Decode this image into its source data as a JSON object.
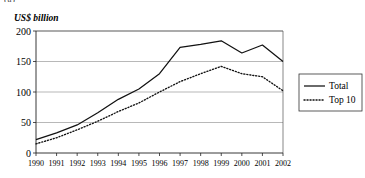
{
  "figure": {
    "caption_fragment": "(a)",
    "y_axis_title": "US$ billion"
  },
  "legend": {
    "position": "right",
    "entries": [
      {
        "label": "Total",
        "style": "solid"
      },
      {
        "label": "Top 10",
        "style": "dotted"
      }
    ]
  },
  "chart_data": {
    "type": "line",
    "title": "",
    "subtitle": "",
    "xlabel": "",
    "ylabel": "US$ billion",
    "categories": [
      "1990",
      "1991",
      "1992",
      "1993",
      "1994",
      "1995",
      "1996",
      "1997",
      "1998",
      "1999",
      "2000",
      "2001",
      "2002"
    ],
    "x": [
      1990,
      1991,
      1992,
      1993,
      1994,
      1995,
      1996,
      1997,
      1998,
      1999,
      2000,
      2001,
      2002
    ],
    "series": [
      {
        "name": "Total",
        "style": "solid",
        "values": [
          22,
          33,
          46,
          66,
          88,
          105,
          130,
          173,
          178,
          184,
          164,
          177,
          150
        ]
      },
      {
        "name": "Top 10",
        "style": "dotted",
        "values": [
          15,
          25,
          38,
          52,
          68,
          82,
          100,
          117,
          130,
          142,
          130,
          125,
          102
        ]
      }
    ],
    "ylim": [
      0,
      200
    ],
    "yticks": [
      0,
      50,
      100,
      150,
      200
    ],
    "ytick_labels": [
      "0",
      "50",
      "100",
      "150",
      "200"
    ],
    "xlim": [
      1990,
      2002
    ],
    "grid": "horizontal",
    "legend_position": "right-outside",
    "colors": {
      "total": "#111111",
      "top10": "#111111",
      "gridline": "#9a9a9a",
      "axis": "#222222"
    }
  }
}
